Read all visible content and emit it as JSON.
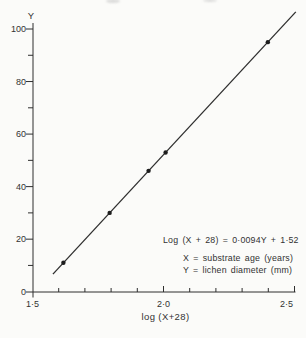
{
  "figure": {
    "background": "#fbfbf9",
    "ink_color": "#2e2e2e"
  },
  "chart_data": {
    "type": "scatter",
    "title": "",
    "xlabel": "log (X+28)",
    "ylabel": "Y",
    "xlim": [
      1.5,
      2.5
    ],
    "ylim": [
      0,
      100
    ],
    "grid": false,
    "legend": "none",
    "x_major_ticks": [
      1.5,
      2.0,
      2.5
    ],
    "x_major_tick_labels": [
      "1·5",
      "2·0",
      "2·5"
    ],
    "x_minor_tick_step": 0.1,
    "y_major_ticks": [
      0,
      20,
      40,
      60,
      80,
      100
    ],
    "y_major_tick_labels": [
      "0",
      "20",
      "40",
      "60",
      "80",
      "100"
    ],
    "y_minor_tick_step": 10,
    "series": [
      {
        "name": "observations",
        "type": "scatter",
        "marker": "filled-circle",
        "points": [
          {
            "x": 1.62,
            "y": 11
          },
          {
            "x": 1.8,
            "y": 30
          },
          {
            "x": 1.95,
            "y": 46
          },
          {
            "x": 2.02,
            "y": 53
          },
          {
            "x": 2.41,
            "y": 95
          }
        ]
      },
      {
        "name": "regression-line",
        "type": "line",
        "from": {
          "x": 1.578,
          "y": 6.7
        },
        "to": {
          "x": 2.505,
          "y": 106.5
        }
      }
    ],
    "equation": {
      "form": "Log (X + 28) = 0.0094Y + 1.52",
      "slope": 0.0094,
      "intercept": 1.52
    },
    "annotations": [
      "Log (X + 28) = 0·0094Y + 1·52",
      "X = substrate age (years)",
      "Y = lichen diameter (mm)"
    ]
  }
}
